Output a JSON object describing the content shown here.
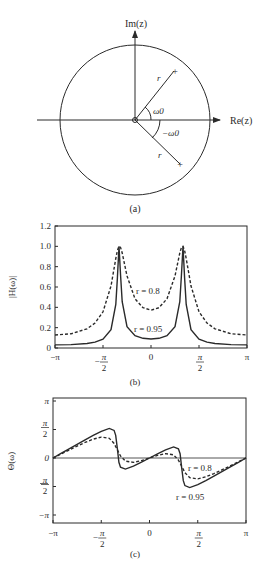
{
  "colors": {
    "ink": "#2a2a2a",
    "background": "#ffffff"
  },
  "panel_a": {
    "caption": "(a)",
    "im_axis_label": "Im(z)",
    "re_axis_label": "Re(z)",
    "radius_label": "r",
    "angle_label_upper": "ω0",
    "angle_label_lower": "−ω0",
    "pole_marker": "+",
    "zero_marker": "o"
  },
  "panel_b": {
    "caption": "(b)",
    "ylabel": "|H(ω)|",
    "yticks": [
      "0",
      "0.2",
      "0.4",
      "0.6",
      "0.8",
      "1.0",
      "1.2"
    ],
    "xticks": [
      {
        "num": "−π",
        "den": ""
      },
      {
        "num": "−",
        "pi": "π",
        "den": "2"
      },
      {
        "num": "0",
        "den": ""
      },
      {
        "num": "",
        "pi": "π",
        "den": "2"
      },
      {
        "num": "π",
        "den": ""
      }
    ],
    "annotation_dashed": "r = 0.8",
    "annotation_solid": "r = 0.95"
  },
  "panel_c": {
    "caption": "(c)",
    "ylabel": "Θ(ω)",
    "yticks": [
      "−π",
      "−π/2",
      "0",
      "π/2",
      "π"
    ],
    "annotation_dashed": "r = 0.8",
    "annotation_solid": "r = 0.95"
  },
  "chart_data": [
    {
      "type": "diagram",
      "title": "(a) Pole-zero plot",
      "unit_circle": true,
      "zeros": [
        {
          "re": 0,
          "im": 0
        }
      ],
      "poles": [
        {
          "r": "r",
          "angle": "ω0"
        },
        {
          "r": "r",
          "angle": "−ω0"
        }
      ],
      "xlabel": "Re(z)",
      "ylabel": "Im(z)"
    },
    {
      "type": "line",
      "title": "(b)",
      "xlabel": "ω",
      "ylabel": "|H(ω)|",
      "xlim": [
        -1,
        1
      ],
      "x_units": "π",
      "ylim": [
        0,
        1.2
      ],
      "xtick_labels": [
        "−π",
        "−π/2",
        "0",
        "π/2",
        "π"
      ],
      "ytick_labels": [
        "0",
        "0.2",
        "0.4",
        "0.6",
        "0.8",
        "1.0",
        "1.2"
      ],
      "grid": false,
      "legend": "inline annotations",
      "x": [
        -1,
        -0.833,
        -0.667,
        -0.583,
        -0.5,
        -0.417,
        -0.367,
        -0.35,
        -0.333,
        -0.317,
        -0.3,
        -0.25,
        -0.167,
        -0.083,
        0,
        0.083,
        0.167,
        0.25,
        0.3,
        0.317,
        0.333,
        0.35,
        0.367,
        0.417,
        0.5,
        0.583,
        0.667,
        0.833,
        1
      ],
      "series": [
        {
          "name": "r = 0.8",
          "style": "dashed",
          "values": [
            0.128,
            0.14,
            0.189,
            0.245,
            0.356,
            0.61,
            0.88,
            0.959,
            1.0,
            0.988,
            0.934,
            0.709,
            0.484,
            0.396,
            0.372,
            0.396,
            0.484,
            0.709,
            0.934,
            0.988,
            1.0,
            0.959,
            0.88,
            0.61,
            0.356,
            0.245,
            0.189,
            0.14,
            0.128
          ]
        },
        {
          "name": "r = 0.95",
          "style": "solid",
          "values": [
            0.03,
            0.033,
            0.044,
            0.058,
            0.088,
            0.181,
            0.428,
            0.69,
            1.0,
            0.711,
            0.455,
            0.21,
            0.121,
            0.095,
            0.089,
            0.095,
            0.121,
            0.21,
            0.455,
            0.711,
            1.0,
            0.69,
            0.428,
            0.181,
            0.088,
            0.058,
            0.044,
            0.033,
            0.03
          ]
        }
      ]
    },
    {
      "type": "line",
      "title": "(c)",
      "xlabel": "ω",
      "ylabel": "Θ(ω)",
      "xlim": [
        -1,
        1
      ],
      "x_units": "π",
      "ylim": [
        -1,
        1
      ],
      "y_units": "π",
      "xtick_labels": [
        "−π",
        "−π/2",
        "0",
        "π/2",
        "π"
      ],
      "ytick_labels": [
        "−π",
        "−π/2",
        "0",
        "π/2",
        "π"
      ],
      "grid": false,
      "zero_line": true,
      "legend": "inline annotations",
      "x": [
        -1,
        -0.917,
        -0.833,
        -0.75,
        -0.667,
        -0.583,
        -0.5,
        -0.417,
        -0.367,
        -0.35,
        -0.333,
        -0.317,
        -0.3,
        -0.25,
        -0.167,
        -0.083,
        0,
        0.083,
        0.167,
        0.25,
        0.3,
        0.317,
        0.333,
        0.35,
        0.367,
        0.417,
        0.5,
        0.583,
        0.667,
        0.75,
        0.833,
        0.917,
        1
      ],
      "series": [
        {
          "name": "r = 0.8",
          "style": "dashed",
          "values": [
            0,
            0.071,
            0.141,
            0.209,
            0.273,
            0.329,
            0.366,
            0.346,
            0.256,
            0.2,
            0.146,
            0.09,
            0.037,
            -0.054,
            -0.077,
            -0.046,
            0,
            0.046,
            0.077,
            0.054,
            -0.037,
            -0.09,
            -0.146,
            -0.2,
            -0.256,
            -0.346,
            -0.366,
            -0.329,
            -0.273,
            -0.209,
            -0.141,
            -0.071,
            0
          ]
        },
        {
          "name": "r = 0.95",
          "style": "solid",
          "values": [
            0,
            0.081,
            0.161,
            0.241,
            0.319,
            0.396,
            0.467,
            0.519,
            0.484,
            0.399,
            0.162,
            -0.075,
            -0.161,
            -0.195,
            -0.144,
            -0.074,
            0,
            0.074,
            0.144,
            0.195,
            0.161,
            0.075,
            -0.162,
            -0.399,
            -0.484,
            -0.519,
            -0.467,
            -0.396,
            -0.319,
            -0.241,
            -0.161,
            -0.081,
            0
          ]
        }
      ]
    }
  ]
}
